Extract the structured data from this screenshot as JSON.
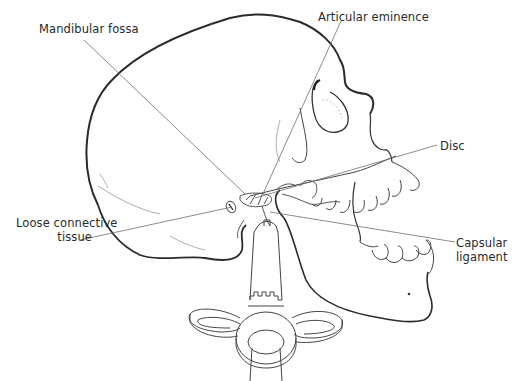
{
  "diagram": {
    "labels": [
      {
        "id": "mandibular-fossa",
        "text": "Mandibular fossa"
      },
      {
        "id": "articular-eminence",
        "text": "Articular eminence"
      },
      {
        "id": "disc",
        "text": "Disc"
      },
      {
        "id": "loose-connective-tissue",
        "line1": "Loose connective",
        "line2": "tissue"
      },
      {
        "id": "capsular-ligament",
        "line1": "Capsular",
        "line2": "ligament"
      }
    ],
    "colors": {
      "outline": "#2b2b2b",
      "leader_line": "#6e6e6e",
      "fine_detail": "#8a8a8a",
      "background": "#ffffff"
    }
  }
}
